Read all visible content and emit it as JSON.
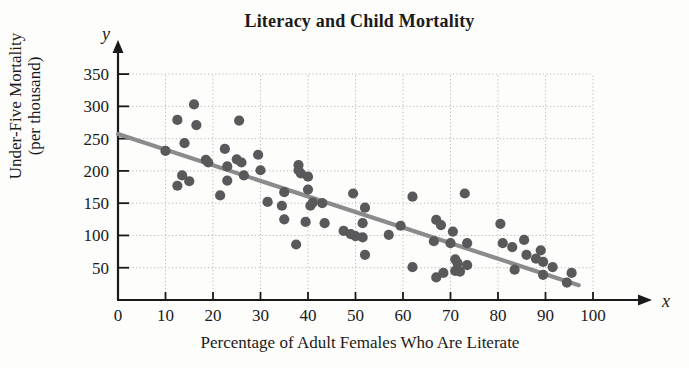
{
  "chart_data": {
    "type": "scatter",
    "title": "Literacy and Child Mortality",
    "xlabel": "Percentage of Adult Females Who Are Literate",
    "ylabel_line1": "Under-Five Mortality",
    "ylabel_line2": "(per thousand)",
    "x_axis_letter": "x",
    "y_axis_letter": "y",
    "xlim": [
      0,
      104
    ],
    "ylim": [
      0,
      378
    ],
    "xticks": [
      0,
      10,
      20,
      30,
      40,
      50,
      60,
      70,
      80,
      90,
      100
    ],
    "xtick_labels": [
      "0",
      "10",
      "20",
      "30",
      "40",
      "50",
      "60",
      "70",
      "80",
      "90",
      "100"
    ],
    "yticks": [
      50,
      100,
      150,
      200,
      250,
      300,
      350
    ],
    "ytick_labels": [
      "50",
      "100",
      "150",
      "200",
      "250",
      "300",
      "350"
    ],
    "grid": true,
    "grid_style": "dotted",
    "legend": null,
    "point_color": "#59595b",
    "line_color": "#8b8b8d",
    "axis_color": "#1a1a1a",
    "grid_color": "#b9b9b9",
    "points": [
      [
        10,
        231
      ],
      [
        12.5,
        279
      ],
      [
        12.5,
        177
      ],
      [
        13.5,
        193
      ],
      [
        14,
        243
      ],
      [
        15,
        184
      ],
      [
        16,
        303
      ],
      [
        16.5,
        271
      ],
      [
        18.5,
        217
      ],
      [
        19,
        213
      ],
      [
        21.5,
        162
      ],
      [
        22.5,
        234
      ],
      [
        23,
        207
      ],
      [
        23,
        185
      ],
      [
        25,
        218
      ],
      [
        25.5,
        278
      ],
      [
        26,
        213
      ],
      [
        26.5,
        193
      ],
      [
        29.5,
        225
      ],
      [
        30,
        201
      ],
      [
        31.5,
        152
      ],
      [
        34.5,
        146
      ],
      [
        35,
        167
      ],
      [
        35,
        125
      ],
      [
        37.5,
        86
      ],
      [
        38,
        209
      ],
      [
        38,
        201
      ],
      [
        38.5,
        196
      ],
      [
        39.5,
        121
      ],
      [
        40,
        191
      ],
      [
        40,
        171
      ],
      [
        40.5,
        146
      ],
      [
        41,
        151
      ],
      [
        43,
        150
      ],
      [
        43.5,
        119
      ],
      [
        47.5,
        107
      ],
      [
        49,
        102
      ],
      [
        49.5,
        165
      ],
      [
        50,
        99
      ],
      [
        51.5,
        119
      ],
      [
        51.5,
        97
      ],
      [
        52,
        70
      ],
      [
        52,
        143
      ],
      [
        57,
        101
      ],
      [
        59.5,
        115
      ],
      [
        62,
        160
      ],
      [
        62,
        51
      ],
      [
        66.5,
        91
      ],
      [
        67,
        124
      ],
      [
        67,
        35
      ],
      [
        68,
        116
      ],
      [
        68.5,
        42
      ],
      [
        70,
        88
      ],
      [
        70.5,
        106
      ],
      [
        71,
        63
      ],
      [
        71,
        45
      ],
      [
        71.5,
        57
      ],
      [
        72,
        44
      ],
      [
        73,
        165
      ],
      [
        73.5,
        88
      ],
      [
        73.5,
        54
      ],
      [
        80.5,
        118
      ],
      [
        81,
        88
      ],
      [
        83,
        82
      ],
      [
        83.5,
        47
      ],
      [
        85.5,
        93
      ],
      [
        86,
        70
      ],
      [
        88,
        64
      ],
      [
        89,
        77
      ],
      [
        89.5,
        59
      ],
      [
        89.5,
        39
      ],
      [
        91.5,
        51
      ],
      [
        94.5,
        27
      ],
      [
        95.5,
        42
      ]
    ],
    "trend_line": {
      "x_start": 0,
      "y_start": 257,
      "x_end": 97,
      "y_end": 23,
      "description": "negative linear trend line"
    }
  }
}
